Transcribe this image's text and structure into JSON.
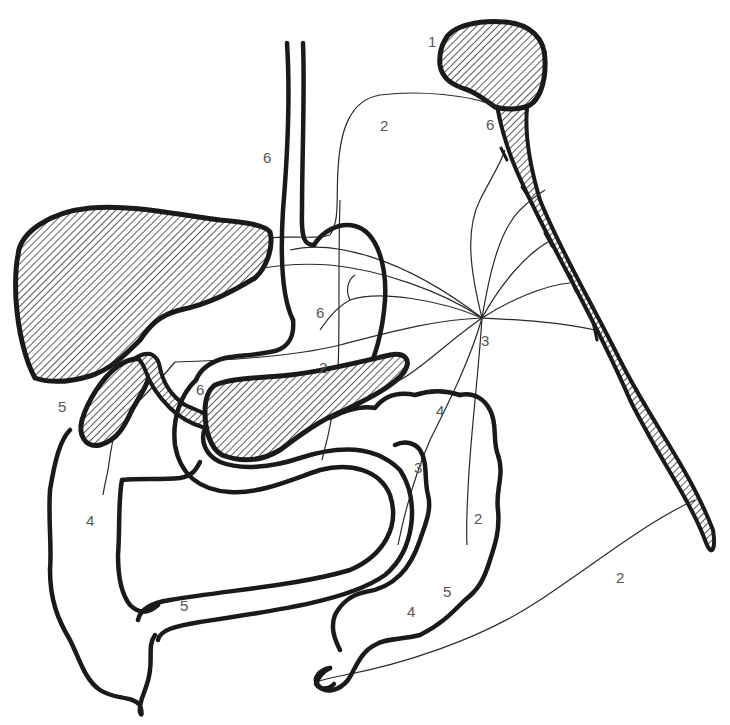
{
  "diagram": {
    "type": "anatomical-line-drawing",
    "colors": {
      "outline": "#1a1a1a",
      "hatch": "#333333",
      "label": "#555555",
      "background": "#ffffff"
    },
    "labels": [
      {
        "id": "l1",
        "text": "1",
        "x": 428,
        "y": 47,
        "near": "brain"
      },
      {
        "id": "l2a",
        "text": "2",
        "x": 380,
        "y": 131,
        "near": "vagus-nerve-upper"
      },
      {
        "id": "l6a",
        "text": "6",
        "x": 486,
        "y": 130,
        "near": "brainstem"
      },
      {
        "id": "l6b",
        "text": "6",
        "x": 263,
        "y": 163,
        "near": "esophagus"
      },
      {
        "id": "l6c",
        "text": "6",
        "x": 316,
        "y": 318,
        "near": "stomach"
      },
      {
        "id": "l3a",
        "text": "3",
        "x": 481,
        "y": 346,
        "near": "celiac-ganglion"
      },
      {
        "id": "l2b",
        "text": "2",
        "x": 319,
        "y": 373,
        "near": "pancreas-nerve"
      },
      {
        "id": "l6d",
        "text": "6",
        "x": 196,
        "y": 395,
        "near": "bile-duct"
      },
      {
        "id": "l5a",
        "text": "5",
        "x": 58,
        "y": 412,
        "near": "gallbladder"
      },
      {
        "id": "l4a",
        "text": "4",
        "x": 436,
        "y": 416,
        "near": "transverse-colon"
      },
      {
        "id": "l3b",
        "text": "3",
        "x": 414,
        "y": 473,
        "near": "descending-colon-nerve"
      },
      {
        "id": "l4b",
        "text": "4",
        "x": 86,
        "y": 526,
        "near": "ascending-colon"
      },
      {
        "id": "l2c",
        "text": "2",
        "x": 474,
        "y": 524,
        "near": "descending-colon"
      },
      {
        "id": "l5b",
        "text": "5",
        "x": 443,
        "y": 597,
        "near": "sigmoid-colon"
      },
      {
        "id": "l4c",
        "text": "4",
        "x": 407,
        "y": 617,
        "near": "sigmoid-colon"
      },
      {
        "id": "l5c",
        "text": "5",
        "x": 180,
        "y": 611,
        "near": "small-intestine"
      },
      {
        "id": "l2d",
        "text": "2",
        "x": 616,
        "y": 583,
        "near": "pelvic-nerve"
      }
    ],
    "structures": [
      "brain",
      "spinal-cord",
      "esophagus",
      "liver",
      "stomach",
      "gallbladder",
      "bile-duct",
      "pancreas",
      "duodenum",
      "small-intestine",
      "ascending-colon",
      "transverse-colon",
      "descending-colon",
      "sigmoid-colon",
      "rectum",
      "celiac-ganglion",
      "vagus-nerve",
      "sympathetic-nerves",
      "pelvic-nerve"
    ]
  }
}
